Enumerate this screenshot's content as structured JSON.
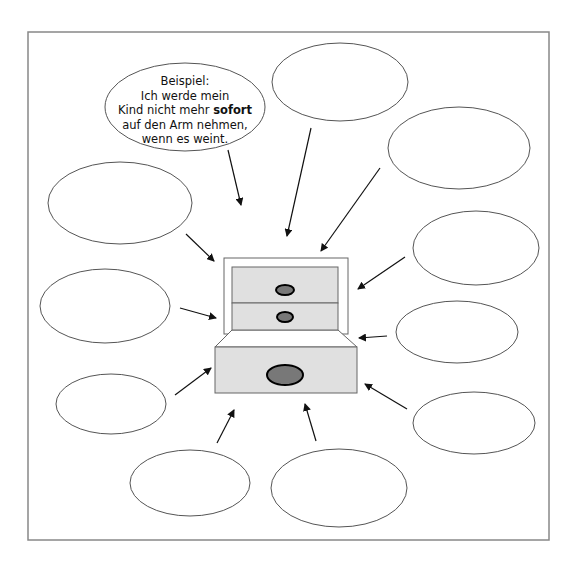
{
  "diagram": {
    "type": "mind-map worksheet",
    "frame": {
      "x": 28,
      "y": 32,
      "width": 521,
      "height": 508,
      "stroke": "#888888"
    },
    "colors": {
      "line": "#555555",
      "arrow": "#111111",
      "drawer_fill": "#e0e0e0",
      "drawer_stroke": "#666666",
      "knob_fill": "#787878",
      "knob_stroke": "#000000"
    },
    "example_bubble": {
      "label": "Beispiel:",
      "line1": "Ich werde mein",
      "line2_prefix": "Kind nicht mehr ",
      "line2_bold": "sofort",
      "line3": "auf den Arm nehmen,",
      "line4": "wenn es weint.",
      "ellipse": {
        "cx": 185,
        "cy": 107,
        "rx": 80,
        "ry": 44
      }
    },
    "empty_bubbles": [
      {
        "id": "top",
        "cx": 340,
        "cy": 82,
        "rx": 68,
        "ry": 39
      },
      {
        "id": "top-right",
        "cx": 459,
        "cy": 148,
        "rx": 71,
        "ry": 41
      },
      {
        "id": "left-upper",
        "cx": 120,
        "cy": 203,
        "rx": 72,
        "ry": 41
      },
      {
        "id": "right-upper",
        "cx": 476,
        "cy": 248,
        "rx": 63,
        "ry": 37
      },
      {
        "id": "left-middle",
        "cx": 105,
        "cy": 306,
        "rx": 65,
        "ry": 37
      },
      {
        "id": "right-middle",
        "cx": 457,
        "cy": 332,
        "rx": 61,
        "ry": 31
      },
      {
        "id": "left-lower",
        "cx": 111,
        "cy": 404,
        "rx": 55,
        "ry": 30
      },
      {
        "id": "right-lower",
        "cx": 474,
        "cy": 423,
        "rx": 61,
        "ry": 31
      },
      {
        "id": "bottom-left",
        "cx": 190,
        "cy": 483,
        "rx": 60,
        "ry": 33
      },
      {
        "id": "bottom-middle",
        "cx": 339,
        "cy": 488,
        "rx": 68,
        "ry": 39
      }
    ],
    "arrows": [
      {
        "from": "example",
        "x1": 228,
        "y1": 150,
        "x2": 241,
        "y2": 205
      },
      {
        "from": "top",
        "x1": 311,
        "y1": 128,
        "x2": 287,
        "y2": 236
      },
      {
        "from": "top-right",
        "x1": 380,
        "y1": 168,
        "x2": 321,
        "y2": 251
      },
      {
        "from": "left-upper",
        "x1": 186,
        "y1": 234,
        "x2": 214,
        "y2": 261
      },
      {
        "from": "right-upper",
        "x1": 405,
        "y1": 257,
        "x2": 358,
        "y2": 289
      },
      {
        "from": "left-middle",
        "x1": 180,
        "y1": 308,
        "x2": 216,
        "y2": 318
      },
      {
        "from": "right-middle",
        "x1": 387,
        "y1": 336,
        "x2": 359,
        "y2": 338
      },
      {
        "from": "left-lower",
        "x1": 175,
        "y1": 395,
        "x2": 211,
        "y2": 368
      },
      {
        "from": "right-lower",
        "x1": 407,
        "y1": 409,
        "x2": 365,
        "y2": 384
      },
      {
        "from": "bottom-left",
        "x1": 217,
        "y1": 443,
        "x2": 234,
        "y2": 410
      },
      {
        "from": "bottom-middle",
        "x1": 316,
        "y1": 441,
        "x2": 305,
        "y2": 404
      }
    ],
    "cabinet": {
      "frame": {
        "x": 224,
        "y": 258,
        "width": 124,
        "height": 76
      },
      "drawer_top": {
        "x": 232,
        "y": 267,
        "width": 106,
        "height": 36,
        "knob": {
          "cx": 285,
          "cy": 290,
          "rx": 9,
          "ry": 5
        }
      },
      "drawer_middle": {
        "x": 232,
        "y": 303,
        "width": 106,
        "height": 27,
        "knob": {
          "cx": 285,
          "cy": 317,
          "rx": 8,
          "ry": 5
        }
      },
      "drawer_bottom": {
        "x": 215,
        "y": 347,
        "width": 142,
        "height": 46,
        "knob": {
          "cx": 285,
          "cy": 375,
          "rx": 18,
          "ry": 10
        }
      },
      "trapezoid": {
        "inner_left": 232,
        "inner_right": 338,
        "inner_y": 330,
        "outer_left": 215,
        "outer_right": 357,
        "outer_y": 347
      }
    }
  }
}
